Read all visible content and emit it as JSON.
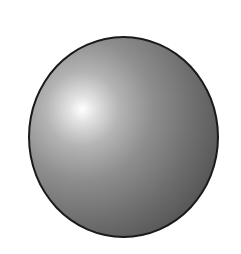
{
  "figure": {
    "colors": {
      "highlight": "#ffffff",
      "midtone": "#8e8e8e",
      "shadow": "#3e3e3e",
      "outline": "#1a1a1a",
      "background": "#ffffff"
    }
  }
}
